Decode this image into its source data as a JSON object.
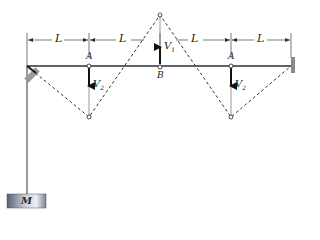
{
  "figure": {
    "type": "standing-wave-on-string",
    "labels": {
      "segment_length": "L",
      "point_A": "A",
      "point_B": "B",
      "velocity_1": "V",
      "velocity_1_sub": "1",
      "velocity_2": "V",
      "velocity_2_sub": "2",
      "mass": "M"
    },
    "dimension_segments": [
      "L",
      "L",
      "L",
      "L"
    ],
    "colors": {
      "line": "#2a2f3a",
      "dim_line": "#555555",
      "wall": "#8a8a8a",
      "mass_light": "#e4e6ee",
      "mass_dark": "#5a5f73"
    }
  }
}
